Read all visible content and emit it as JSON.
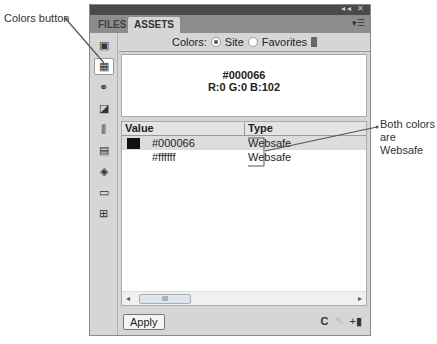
{
  "callouts": {
    "colors_button": "Colors button",
    "websafe_line1": "Both colors",
    "websafe_line2": "are Websafe"
  },
  "panel": {
    "title_controls": "◂◂ ✕",
    "tabs": [
      {
        "label": "FILES",
        "active": false
      },
      {
        "label": "ASSETS",
        "active": true
      }
    ],
    "tab_menu_icon": "▾☰",
    "sidebar": [
      {
        "name": "images-icon",
        "glyph": "▣"
      },
      {
        "name": "colors-icon",
        "glyph": "▦",
        "active": true
      },
      {
        "name": "urls-icon",
        "glyph": "⚭"
      },
      {
        "name": "swf-icon",
        "glyph": "◪"
      },
      {
        "name": "shockwave-icon",
        "glyph": "⫼"
      },
      {
        "name": "movies-icon",
        "glyph": "▤"
      },
      {
        "name": "scripts-icon",
        "glyph": "◈"
      },
      {
        "name": "templates-icon",
        "glyph": "▭"
      },
      {
        "name": "library-icon",
        "glyph": "⊞"
      }
    ],
    "colors_label": "Colors:",
    "site_label": "Site",
    "favorites_label": "Favorites",
    "preview": {
      "hex": "#000066",
      "rgb": "R:0 G:0 B:102"
    },
    "table": {
      "headers": [
        "Value",
        "Type"
      ],
      "rows": [
        {
          "swatch": "#000066",
          "value": "#000066",
          "type": "Websafe",
          "selected": true
        },
        {
          "swatch": "#ffffff",
          "value": "#ffffff",
          "type": "Websafe",
          "selected": false
        }
      ]
    },
    "scroll_left": "◂",
    "scroll_right": "▸",
    "scroll_thumb": "III",
    "apply_label": "Apply",
    "footer_icons": {
      "refresh": "C",
      "edit": "✎",
      "add": "+▮"
    }
  }
}
